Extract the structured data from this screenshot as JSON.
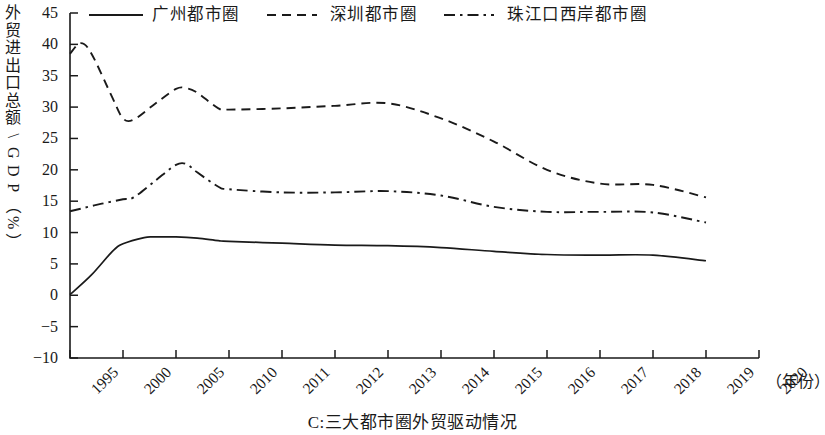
{
  "chart_data": {
    "type": "line",
    "title": "",
    "caption": "C:三大都市圈外贸驱动情况",
    "xlabel": "（年份）",
    "ylabel": "外贸进出口总额\\GDP（%）",
    "ylim": [
      -10,
      45
    ],
    "y_ticks": [
      45,
      40,
      35,
      30,
      25,
      20,
      15,
      10,
      5,
      0,
      -5,
      -10
    ],
    "x_ticks": [
      "1995",
      "2000",
      "2005",
      "2010",
      "2011",
      "2012",
      "2013",
      "2014",
      "2015",
      "2016",
      "2017",
      "2018",
      "2019",
      "2020"
    ],
    "grid": false,
    "legend_position": "top",
    "line_color": "#1a1a1a",
    "series": [
      {
        "name": "广州都市圈",
        "style": "solid",
        "x": [
          "1995",
          "1997",
          "1999",
          "2000",
          "2002",
          "2003",
          "2005",
          "2007",
          "2009",
          "2010",
          "2011",
          "2012",
          "2013",
          "2014",
          "2015",
          "2016",
          "2017",
          "2018",
          "2019"
        ],
        "values": [
          0.1,
          3.2,
          7.0,
          8.2,
          9.2,
          9.3,
          9.3,
          9.1,
          8.7,
          8.6,
          8.3,
          8.0,
          7.9,
          7.6,
          7.0,
          6.5,
          6.4,
          6.4,
          5.5
        ]
      },
      {
        "name": "深圳都市圈",
        "style": "dashed",
        "x": [
          "1995",
          "1996",
          "1997",
          "1999",
          "2000",
          "2001",
          "2003",
          "2005",
          "2006",
          "2007",
          "2009",
          "2010",
          "2011",
          "2012",
          "2013",
          "2014",
          "2015",
          "2016",
          "2017",
          "2018",
          "2019"
        ],
        "values": [
          38.5,
          40.2,
          38.6,
          31.5,
          28.2,
          28.0,
          30.5,
          32.9,
          33.0,
          32.3,
          29.8,
          29.6,
          29.8,
          30.2,
          30.6,
          28.2,
          24.5,
          20.0,
          17.8,
          17.6,
          15.6
        ]
      },
      {
        "name": "珠江口西岸都市圈",
        "style": "dashdot",
        "x": [
          "1995",
          "1996",
          "1998",
          "2000",
          "2001",
          "2003",
          "2005",
          "2006",
          "2007",
          "2009",
          "2010",
          "2011",
          "2012",
          "2013",
          "2014",
          "2015",
          "2016",
          "2017",
          "2018",
          "2019"
        ],
        "values": [
          13.4,
          13.8,
          14.6,
          15.3,
          15.6,
          18.2,
          20.8,
          20.9,
          19.6,
          17.3,
          16.9,
          16.4,
          16.4,
          16.6,
          15.9,
          14.1,
          13.3,
          13.3,
          13.2,
          11.6
        ]
      }
    ]
  },
  "legend": {
    "entries": [
      {
        "label": "广州都市圈",
        "style": "solid"
      },
      {
        "label": "深圳都市圈",
        "style": "dashed"
      },
      {
        "label": "珠江口西岸都市圈",
        "style": "dashdot"
      }
    ]
  },
  "axes": {
    "y_title": "外贸进出口总额\\GDP（%）",
    "y_ticks": [
      "45",
      "40",
      "35",
      "30",
      "25",
      "20",
      "15",
      "10",
      "5",
      "0",
      "-5",
      "-10"
    ],
    "x_ticks": [
      "1995",
      "2000",
      "2005",
      "2010",
      "2011",
      "2012",
      "2013",
      "2014",
      "2015",
      "2016",
      "2017",
      "2018",
      "2019",
      "2020"
    ],
    "x_unit": "（年份）"
  },
  "caption": "C:三大都市圈外贸驱动情况"
}
